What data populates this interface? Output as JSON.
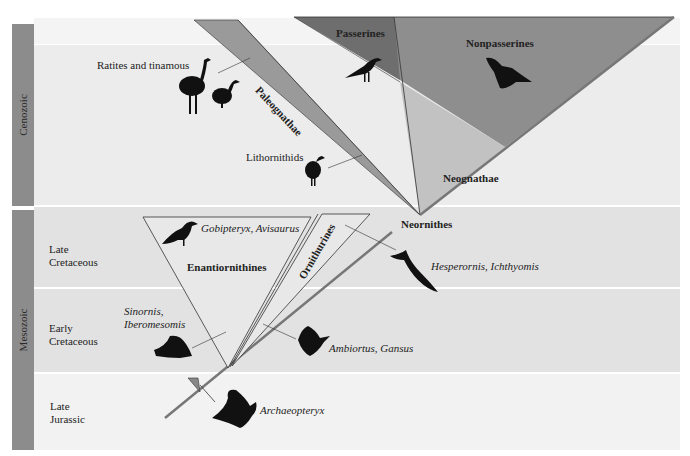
{
  "eras": [
    {
      "label": "Cenozoic"
    },
    {
      "label": "Mesozoic"
    }
  ],
  "periods": [
    {
      "line1": "Late",
      "line2": "Cretaceous"
    },
    {
      "line1": "Early",
      "line2": "Cretaceous"
    },
    {
      "line1": "Late",
      "line2": "Jurassic"
    }
  ],
  "clades": {
    "passerines": "Passerines",
    "nonpasserines": "Nonpasserines",
    "paleognathae": "Paleognathae",
    "neognathae": "Neognathae",
    "neornithes": "Neornithes",
    "enantiornithines": "Enantiornithines",
    "ornithurines": "Ornithurines"
  },
  "taxa": {
    "ratites": "Ratites and tinamous",
    "lithornithids": "Lithornithids",
    "gobipteryx": "Gobipteryx, Avisaurus",
    "sinornis_1": "Sinornis,",
    "sinornis_2": "Iberomesomis",
    "hesperornis": "Hesperornis, Ichthyomis",
    "ambiortus": "Ambiortus, Gansus",
    "archaeopteryx": "Archaeopteryx"
  },
  "colors": {
    "band_light": "#f1f1f1",
    "band_mid": "#e3e3e3",
    "era_bar": "#8c8c8c",
    "nonpasserines": "#8e8e8e",
    "passerines": "#747474",
    "paleognathae": "#9a9a9a",
    "neognathae": "#c4c4c4",
    "trunk": "#7a7a7a"
  }
}
